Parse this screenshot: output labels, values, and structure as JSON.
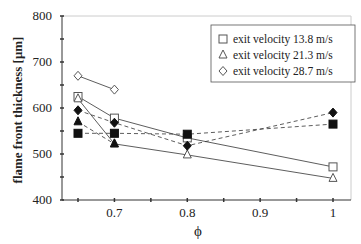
{
  "chart_data": {
    "type": "line",
    "title": "",
    "xlabel": "ϕ",
    "ylabel": "flame front thickness  [μm]",
    "xlim": [
      0.625,
      1.025
    ],
    "ylim": [
      400,
      800
    ],
    "xticks": [
      0.65,
      0.7,
      0.75,
      0.8,
      0.85,
      0.9,
      0.95,
      1.0
    ],
    "xtick_labels": [
      "0.7",
      "0.8",
      "0.9",
      "1"
    ],
    "xtick_label_values": [
      0.7,
      0.8,
      0.9,
      1.0
    ],
    "yticks": [
      400,
      450,
      500,
      550,
      600,
      650,
      700,
      750,
      800
    ],
    "ytick_labels": [
      "400",
      "500",
      "600",
      "700",
      "800"
    ],
    "ytick_label_values": [
      400,
      500,
      600,
      700,
      800
    ],
    "grid": false,
    "legend_position": "upper right",
    "legend": [
      {
        "marker": "open-square",
        "label": "exit velocity 13.8 m/s"
      },
      {
        "marker": "open-triangle",
        "label": "exit velocity 21.3 m/s"
      },
      {
        "marker": "open-diamond",
        "label": "exit velocity 28.7 m/s"
      }
    ],
    "series": [
      {
        "name": "exit velocity 13.8 m/s (open)",
        "marker": "open-square",
        "line": "solid",
        "x": [
          0.65,
          0.7,
          0.8,
          1.0
        ],
        "values": [
          625,
          578,
          535,
          472
        ]
      },
      {
        "name": "exit velocity 21.3 m/s (open)",
        "marker": "open-triangle",
        "line": "solid",
        "x": [
          0.65,
          0.7,
          0.8,
          1.0
        ],
        "values": [
          620,
          522,
          498,
          447
        ]
      },
      {
        "name": "exit velocity 28.7 m/s (open)",
        "marker": "open-diamond",
        "line": "solid",
        "x": [
          0.65,
          0.7
        ],
        "values": [
          670,
          640
        ]
      },
      {
        "name": "exit velocity 13.8 m/s (filled)",
        "marker": "filled-square",
        "line": "dashed",
        "x": [
          0.65,
          0.7,
          0.8,
          1.0
        ],
        "values": [
          545,
          545,
          543,
          565
        ]
      },
      {
        "name": "exit velocity 21.3 m/s (filled)",
        "marker": "filled-triangle",
        "line": "dashed",
        "x": [
          0.65,
          0.7
        ],
        "values": [
          570,
          522
        ]
      },
      {
        "name": "exit velocity 28.7 m/s (filled)",
        "marker": "filled-diamond",
        "line": "dashed",
        "x": [
          0.65,
          0.7,
          0.8,
          1.0
        ],
        "values": [
          595,
          568,
          518,
          590
        ]
      }
    ]
  },
  "colors": {
    "axis": "#333333",
    "frame": "#cccccc",
    "line": "#333333",
    "marker": "#111111"
  }
}
